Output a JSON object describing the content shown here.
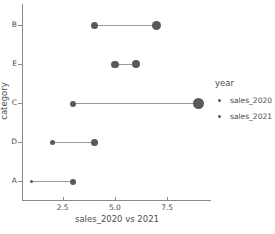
{
  "chart_data": {
    "type": "scatter",
    "subtype": "dumbbell",
    "title": "",
    "xlabel": "sales_2020 vs 2021",
    "ylabel": "category",
    "categories": [
      "B",
      "E",
      "C",
      "D",
      "A"
    ],
    "xticks": [
      2.5,
      5.0,
      7.5
    ],
    "xticklabels": [
      "2.5",
      "5.0",
      "7.5"
    ],
    "xlim": [
      0.6,
      9.6
    ],
    "grid": false,
    "legend": {
      "title": "year",
      "position": "right",
      "entries": [
        {
          "label": "sales_2020",
          "marker_size": 3
        },
        {
          "label": "sales_2021",
          "marker_size": 3
        }
      ]
    },
    "series": [
      {
        "name": "sales_2020",
        "values": [
          4,
          5,
          3,
          2,
          1
        ]
      },
      {
        "name": "sales_2021",
        "values": [
          7,
          6,
          9,
          4,
          3
        ]
      }
    ],
    "points": [
      {
        "category": "B",
        "series": "sales_2020",
        "value": 4,
        "size": 7
      },
      {
        "category": "B",
        "series": "sales_2021",
        "value": 7,
        "size": 9
      },
      {
        "category": "E",
        "series": "sales_2020",
        "value": 5,
        "size": 7.5
      },
      {
        "category": "E",
        "series": "sales_2021",
        "value": 6,
        "size": 8
      },
      {
        "category": "C",
        "series": "sales_2020",
        "value": 3,
        "size": 6
      },
      {
        "category": "C",
        "series": "sales_2021",
        "value": 9,
        "size": 11
      },
      {
        "category": "D",
        "series": "sales_2020",
        "value": 2,
        "size": 5
      },
      {
        "category": "D",
        "series": "sales_2021",
        "value": 4,
        "size": 7
      },
      {
        "category": "A",
        "series": "sales_2020",
        "value": 1,
        "size": 3
      },
      {
        "category": "A",
        "series": "sales_2021",
        "value": 3,
        "size": 6
      }
    ],
    "colors": {
      "marker": "#595959",
      "connector": "#9a9a9a",
      "axis": "#8a8a8a",
      "text": "#4d4d4d",
      "background": "#ffffff"
    }
  }
}
